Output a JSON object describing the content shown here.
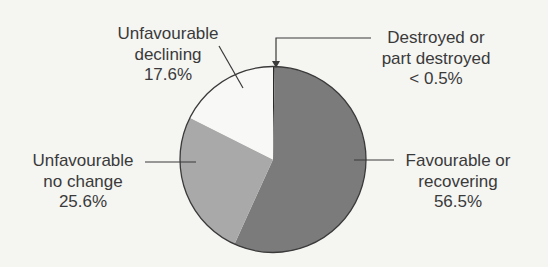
{
  "chart_data": {
    "type": "pie",
    "title": "",
    "start_angle_deg": 0,
    "direction": "clockwise",
    "slices": [
      {
        "name": "Destroyed or part destroyed",
        "label_lines": [
          "Destroyed or",
          "part destroyed",
          "< 0.5%"
        ],
        "value": 0.3,
        "value_label": "< 0.5%",
        "color": "#2a2a2a"
      },
      {
        "name": "Favourable or recovering",
        "label_lines": [
          "Favourable or",
          "recovering",
          "56.5%"
        ],
        "value": 56.5,
        "value_label": "56.5%",
        "color": "#7b7b7b"
      },
      {
        "name": "Unfavourable no change",
        "label_lines": [
          "Unfavourable",
          "no change",
          "25.6%"
        ],
        "value": 25.6,
        "value_label": "25.6%",
        "color": "#a9a9a9"
      },
      {
        "name": "Unfavourable declining",
        "label_lines": [
          "Unfavourable",
          "declining",
          "17.6%"
        ],
        "value": 17.6,
        "value_label": "17.6%",
        "color": "#f8f8f6"
      }
    ],
    "legend": "none (callout labels with leader lines)",
    "units": "%"
  },
  "labels": {
    "declining": {
      "line1": "Unfavourable",
      "line2": "declining",
      "line3": "17.6%"
    },
    "destroyed": {
      "line1": "Destroyed or",
      "line2": "part destroyed",
      "line3": "< 0.5%"
    },
    "no_change": {
      "line1": "Unfavourable",
      "line2": "no change",
      "line3": "25.6%"
    },
    "favourable": {
      "line1": "Favourable or",
      "line2": "recovering",
      "line3": "56.5%"
    }
  },
  "colors": {
    "background": "#f5f5f2",
    "outline": "#3a3a3a",
    "text": "#3a3a3a"
  }
}
